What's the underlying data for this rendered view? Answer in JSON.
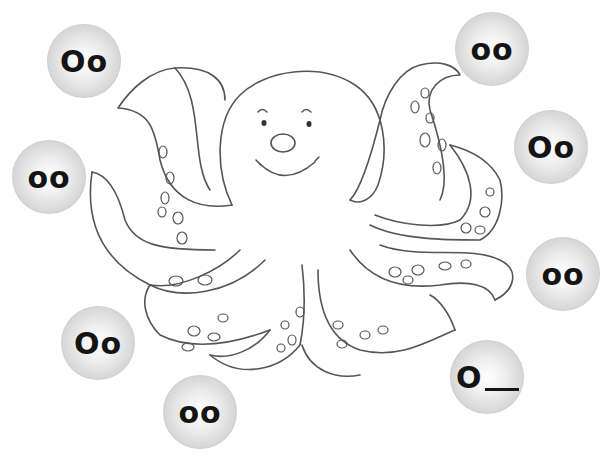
{
  "worksheet": {
    "subject": "octopus",
    "bubbles": [
      {
        "id": "tl",
        "text": "Oo",
        "x": 47,
        "y": 24
      },
      {
        "id": "l",
        "text": "oo",
        "x": 12,
        "y": 140
      },
      {
        "id": "bl",
        "text": "Oo",
        "x": 61,
        "y": 306
      },
      {
        "id": "b",
        "text": "oo",
        "x": 163,
        "y": 375
      },
      {
        "id": "tr",
        "text": "oo",
        "x": 455,
        "y": 12
      },
      {
        "id": "r",
        "text": "Oo",
        "x": 514,
        "y": 110
      },
      {
        "id": "rl",
        "text": "oo",
        "x": 526,
        "y": 237
      },
      {
        "id": "br",
        "text": "O",
        "blank": true,
        "x": 450,
        "y": 340
      }
    ]
  }
}
